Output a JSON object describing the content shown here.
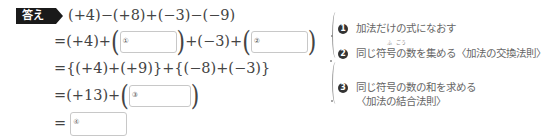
{
  "badge": {
    "label": "答え"
  },
  "lines": [
    {
      "text": "(+4)−(+8)+(−3)−(−9)"
    },
    {
      "pre": "=(+4)+",
      "mid": "+(−3)+",
      "box1": "①",
      "box2": "②"
    },
    {
      "text": "={(+4)+(+9)}+{(−8)+(−3)}"
    },
    {
      "pre": "=(+13)+",
      "box3": "③"
    },
    {
      "pre": "=",
      "box4": "④"
    }
  ],
  "notes": [
    {
      "marker": "1",
      "text": "加法だけの式になおす"
    },
    {
      "marker": "2",
      "text": "同じ符号の数を集める〈加法の交換法則〉",
      "ruby1": "ふ",
      "ruby2": "ごう"
    },
    {
      "marker": "3",
      "text": "同じ符号の数の和を求める",
      "text2": "〈加法の結合法則〉"
    }
  ]
}
